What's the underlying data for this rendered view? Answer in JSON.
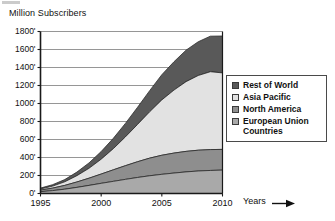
{
  "chart_data": {
    "type": "area",
    "title": "Million Subscribers",
    "ylabel": "Million Subscribers",
    "xlabel": "Years",
    "x": [
      1995,
      1996,
      1997,
      1998,
      1999,
      2000,
      2001,
      2002,
      2003,
      2004,
      2005,
      2006,
      2007,
      2008,
      2009,
      2010
    ],
    "xlim": [
      1995,
      2010
    ],
    "ylim": [
      0,
      1800
    ],
    "ytick_values": [
      0,
      200,
      400,
      600,
      800,
      1000,
      1200,
      1400,
      1600,
      1800
    ],
    "ytick_labels": [
      "0'",
      "200'",
      "400'",
      "600'",
      "800'",
      "1000'",
      "1200'",
      "1400'",
      "1600'",
      "1800'"
    ],
    "xtick_labels": [
      "1995",
      "2000",
      "2005",
      "2010"
    ],
    "xtick_values": [
      1995,
      2000,
      2005,
      2010
    ],
    "grid": "horizontal",
    "stacked": true,
    "stack_order_bottom_to_top": [
      "European Union Countries",
      "North America",
      "Asia Pacific",
      "Rest of World"
    ],
    "legend_position": "right",
    "series": [
      {
        "name": "Rest of World",
        "color": "#595959",
        "values": [
          10,
          16,
          25,
          40,
          60,
          85,
          115,
          150,
          190,
          235,
          280,
          315,
          350,
          375,
          395,
          410
        ]
      },
      {
        "name": "Asia Pacific",
        "color": "#e2e2e2",
        "values": [
          12,
          22,
          40,
          70,
          110,
          165,
          235,
          320,
          415,
          515,
          615,
          700,
          775,
          830,
          865,
          850
        ]
      },
      {
        "name": "North America",
        "color": "#8e8e8e",
        "values": [
          18,
          28,
          42,
          60,
          80,
          103,
          128,
          152,
          175,
          196,
          212,
          222,
          228,
          231,
          232,
          230
        ]
      },
      {
        "name": "European Union Countries",
        "color": "#a9a9a9",
        "values": [
          20,
          32,
          48,
          68,
          90,
          113,
          135,
          157,
          178,
          197,
          213,
          227,
          240,
          250,
          256,
          260
        ]
      }
    ],
    "cumulative_totals": [
      60,
      98,
      155,
      238,
      340,
      466,
      613,
      779,
      958,
      1143,
      1320,
      1464,
      1593,
      1686,
      1748,
      1750
    ],
    "cumulative_at_2010": {
      "European Union Countries": 260,
      "North America": 490,
      "Asia Pacific": 1340,
      "Rest of World": 1750
    }
  },
  "legend": {
    "items": [
      {
        "label": "Rest of World",
        "color": "#595959"
      },
      {
        "label": "Asia Pacific",
        "color": "#e2e2e2"
      },
      {
        "label": "North America",
        "color": "#8e8e8e"
      },
      {
        "label": "European Union\nCountries",
        "color": "#a9a9a9"
      }
    ]
  },
  "axes": {
    "y_title": "Million Subscribers",
    "x_title": "Years",
    "y_ticks": [
      "1800'",
      "1600'",
      "1400'",
      "1200'",
      "1000'",
      "800'",
      "600'",
      "400'",
      "200'",
      "0'"
    ],
    "x_ticks": [
      "1995",
      "2000",
      "2005",
      "2010"
    ]
  }
}
